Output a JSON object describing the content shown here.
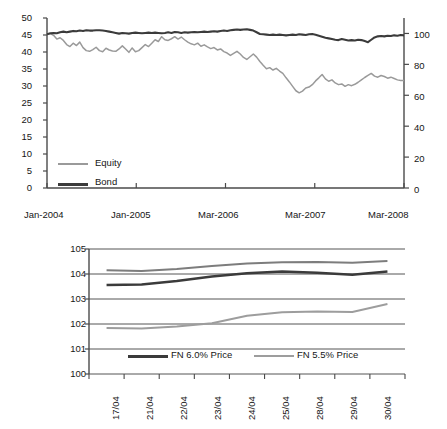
{
  "page": {
    "background_color": "#ffffff",
    "series_colors": {
      "dark": "#3b3b3b",
      "light": "#9a9a9a",
      "axis": "#4a4a4a"
    }
  },
  "chart_data": [
    {
      "id": "equity-bond-chart",
      "type": "line",
      "title": "",
      "xlabel": "",
      "ylabel": "",
      "grid": false,
      "legend_position": "inside-lower-left",
      "x_tick_labels": [
        "Jan-2004",
        "Jan-2005",
        "Mar-2006",
        "Mar-2007",
        "Mar-2008"
      ],
      "x_tick_positions": [
        0,
        0.25,
        0.5,
        0.75,
        1.0
      ],
      "left_axis": {
        "ylim": [
          0,
          50
        ],
        "ticks": [
          0,
          5,
          10,
          15,
          20,
          25,
          30,
          35,
          40,
          45,
          50
        ],
        "tick_labels": [
          "0",
          "5",
          "10",
          "15",
          "20",
          "25",
          "30",
          "35",
          "40",
          "45",
          "50"
        ]
      },
      "right_axis": {
        "ylim": [
          0,
          110
        ],
        "ticks": [
          0,
          20,
          40,
          60,
          80,
          100
        ],
        "tick_labels": [
          "0",
          "20",
          "40",
          "60",
          "80",
          "100"
        ]
      },
      "series": [
        {
          "name": "Equity",
          "axis": "left",
          "color": "#9a9a9a",
          "values": [
            45.2,
            45.4,
            44.9,
            43.8,
            44.2,
            43.4,
            42.2,
            41.6,
            42.6,
            41.9,
            42.9,
            41.3,
            40.4,
            40.2,
            40.7,
            41.4,
            40.4,
            40.1,
            41.1,
            40.6,
            40.3,
            40.2,
            40.9,
            41.8,
            40.9,
            39.9,
            41.2,
            40.1,
            40.4,
            41.3,
            42.2,
            41.6,
            42.6,
            43.6,
            43.1,
            44.5,
            43.6,
            43.4,
            43.9,
            44.5,
            43.8,
            44.4,
            43.6,
            42.9,
            42.4,
            42.1,
            42.6,
            41.7,
            42.1,
            41.5,
            41.0,
            41.3,
            40.6,
            40.9,
            40.1,
            39.7,
            39.0,
            39.6,
            40.2,
            39.4,
            38.4,
            37.8,
            38.6,
            39.4,
            38.5,
            37.2,
            36.1,
            35.1,
            35.4,
            34.7,
            35.2,
            34.4,
            33.7,
            32.4,
            31.2,
            29.9,
            28.6,
            28.0,
            28.5,
            29.4,
            29.7,
            30.4,
            31.5,
            32.4,
            33.4,
            32.1,
            31.4,
            31.8,
            30.9,
            30.4,
            30.6,
            29.9,
            30.4,
            30.1,
            30.5,
            31.1,
            31.8,
            32.5,
            33.1,
            33.7,
            32.9,
            32.6,
            33.1,
            32.8,
            32.3,
            32.6,
            32.2,
            31.8,
            31.6,
            31.6
          ]
        },
        {
          "name": "Bond",
          "axis": "left",
          "color": "#3b3b3b",
          "values": [
            45.2,
            45.5,
            45.6,
            45.5,
            45.8,
            46.0,
            45.8,
            46.0,
            46.2,
            46.1,
            46.3,
            46.2,
            46.4,
            46.3,
            46.3,
            46.4,
            46.4,
            46.3,
            46.2,
            46.0,
            45.8,
            45.6,
            45.4,
            45.6,
            45.5,
            45.4,
            45.6,
            45.7,
            45.6,
            45.5,
            45.6,
            45.7,
            45.6,
            45.7,
            45.6,
            45.5,
            45.6,
            45.8,
            45.6,
            45.9,
            45.8,
            45.6,
            45.8,
            45.7,
            45.8,
            45.9,
            45.8,
            45.9,
            46.0,
            45.9,
            46.0,
            46.1,
            46.0,
            46.2,
            46.3,
            46.2,
            46.4,
            46.5,
            46.6,
            46.5,
            46.6,
            46.7,
            46.5,
            46.3,
            45.8,
            45.3,
            45.2,
            45.1,
            45.0,
            45.1,
            45.0,
            45.1,
            45.0,
            44.9,
            45.0,
            45.1,
            45.0,
            45.2,
            45.1,
            45.0,
            45.2,
            45.3,
            45.1,
            44.8,
            44.5,
            44.2,
            44.0,
            43.8,
            43.6,
            43.5,
            43.8,
            43.6,
            43.4,
            43.5,
            43.4,
            43.6,
            43.5,
            43.2,
            42.9,
            43.6,
            44.3,
            44.6,
            44.7,
            44.6,
            44.8,
            44.7,
            44.9,
            44.8,
            45.0,
            44.9
          ]
        }
      ]
    },
    {
      "id": "fn-price-chart",
      "type": "line",
      "title": "",
      "xlabel": "",
      "ylabel": "",
      "grid": true,
      "legend_position": "inside-lower-center",
      "categories": [
        "17/04",
        "21/04",
        "22/04",
        "23/04",
        "24/04",
        "25/04",
        "28/04",
        "29/04",
        "30/04"
      ],
      "ylim": [
        100,
        105
      ],
      "yticks": [
        100,
        101,
        102,
        103,
        104,
        105
      ],
      "ytick_labels": [
        "100",
        "101",
        "102",
        "103",
        "104",
        "105"
      ],
      "series": [
        {
          "name": "FN 6.5% Price",
          "color": "#7d7d7d",
          "in_legend": false,
          "values": [
            104.15,
            104.12,
            104.2,
            104.32,
            104.42,
            104.47,
            104.48,
            104.45,
            104.52
          ]
        },
        {
          "name": "FN 6.0% Price",
          "color": "#3b3b3b",
          "in_legend": true,
          "values": [
            103.56,
            103.58,
            103.72,
            103.9,
            104.03,
            104.1,
            104.05,
            103.97,
            104.1
          ]
        },
        {
          "name": "FN 5.5% Price",
          "color": "#9d9d9d",
          "in_legend": true,
          "values": [
            101.84,
            101.82,
            101.9,
            102.03,
            102.33,
            102.47,
            102.5,
            102.48,
            102.8
          ]
        }
      ]
    }
  ]
}
